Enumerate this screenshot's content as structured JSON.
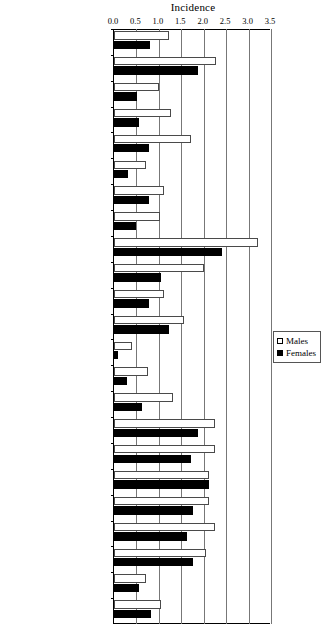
{
  "chart_data": {
    "type": "bar",
    "orientation": "horizontal",
    "title": "Incidence",
    "xlabel": "",
    "ylabel": "",
    "xlim": [
      0.0,
      3.5
    ],
    "xticks": [
      0.0,
      0.5,
      1.0,
      1.5,
      2.0,
      2.5,
      3.0,
      3.5
    ],
    "xtick_labels": [
      "0.0",
      "0.5",
      "1.0",
      "1.5",
      "2.0",
      "2.5",
      "3.0",
      "3.5"
    ],
    "grid": true,
    "grid_axis": "x",
    "legend_position": "right-middle",
    "categories": [
      "World",
      "More developed regions",
      "Less developed regions",
      "Northern Africa",
      "Eastern Africa",
      "MiddleAfrica",
      "Southern Africa",
      "Western Africa",
      "Northern America",
      "Central America",
      "South America",
      "Carribean",
      "Eastern Asia",
      "South-Eastern Asia",
      "South-Central Asia",
      "Western Asia",
      "Northern Europe",
      "Central and Eastern Europe",
      "Southern Europe",
      "Western Europe",
      "Australia/New Zealand",
      "Melanesia",
      "Micronesia"
    ],
    "series": [
      {
        "name": "Males",
        "color": "#ffffff",
        "edge_color": "#4a4a4a",
        "values": [
          1.22,
          2.27,
          1.0,
          1.27,
          1.72,
          0.72,
          1.12,
          1.02,
          3.21,
          2.0,
          1.12,
          1.57,
          0.4,
          0.75,
          1.32,
          2.25,
          2.25,
          2.12,
          2.12,
          2.25,
          2.05,
          0.72,
          1.05
        ]
      },
      {
        "name": "Females",
        "color": "#000000",
        "edge_color": "#000000",
        "values": [
          0.8,
          1.88,
          0.52,
          0.55,
          0.78,
          0.32,
          0.78,
          0.48,
          2.4,
          1.05,
          0.78,
          1.22,
          0.1,
          0.3,
          0.62,
          1.87,
          1.72,
          2.12,
          1.75,
          1.62,
          1.75,
          0.55,
          0.82
        ]
      }
    ]
  },
  "legend": {
    "items": [
      {
        "label": "Males",
        "marker": "open-square"
      },
      {
        "label": "Females",
        "marker": "filled-square"
      }
    ]
  }
}
